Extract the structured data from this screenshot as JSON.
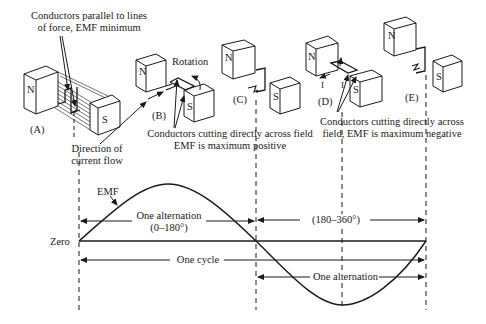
{
  "diagram": {
    "type": "ac-generator-emf-cycle",
    "stages": [
      {
        "id": "A",
        "label": "(A)",
        "north": "N",
        "south": "S"
      },
      {
        "id": "B",
        "label": "(B)",
        "north": "N",
        "south": "S"
      },
      {
        "id": "C",
        "label": "(C)",
        "north": "N",
        "south": "S"
      },
      {
        "id": "D",
        "label": "(D)",
        "north": "N",
        "south": "S"
      },
      {
        "id": "E",
        "label": "(E)",
        "north": "N",
        "south": "S"
      }
    ],
    "annotations": {
      "parallel_line1": "Conductors parallel to lines",
      "parallel_line2": "of force, EMF minimum",
      "direction_line1": "Direction of",
      "direction_line2": "current flow",
      "rotation": "Rotation",
      "positive_line1": "Conductors cutting directly across field",
      "positive_line2": "EMF is maximum positive",
      "negative_line1": "Conductors cutting directly across",
      "negative_line2": "field, EMF is maximum negative",
      "current_symbol_left": "I",
      "current_symbol_right": "I"
    },
    "waveform": {
      "curve_label": "EMF",
      "zero_label": "Zero",
      "first_alternation_line1": "One alternation",
      "first_alternation_line2": "(0–180°)",
      "second_range": "(180–360°)",
      "cycle": "One cycle",
      "second_alternation": "One alternation"
    },
    "colors": {
      "line": "#1a1a1a",
      "background": "#ffffff"
    }
  }
}
